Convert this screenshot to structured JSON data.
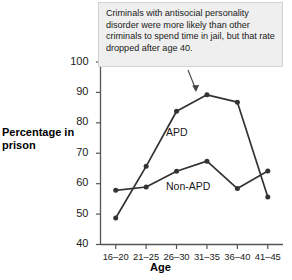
{
  "callout": {
    "text": "Criminals with antisocial personality disorder were more likely than other criminals to spend time in jail, but that rate dropped after age 40.",
    "arrow_icon": "arrow-pointer-icon",
    "background": "#efefef",
    "border": "#d2d2d2"
  },
  "chart_data": {
    "type": "line",
    "title": "",
    "xlabel": "Age",
    "ylabel": "Percentage in prison",
    "categories": [
      "16–20",
      "21–25",
      "26–30",
      "31–35",
      "36–40",
      "41–45"
    ],
    "ylim": [
      40,
      100
    ],
    "yticks": [
      40,
      50,
      60,
      70,
      80,
      90,
      100
    ],
    "ytick_labels": [
      "40",
      "50",
      "60",
      "70",
      "80",
      "90",
      "100"
    ],
    "grid": false,
    "legend": "inline-labels",
    "line_color": "#333333",
    "marker": "circle",
    "series": [
      {
        "name": "APD",
        "values": [
          48.7,
          65.7,
          83.8,
          89.2,
          86.8,
          55.6
        ]
      },
      {
        "name": "Non-APD",
        "values": [
          57.8,
          58.9,
          64.1,
          67.4,
          58.4,
          64.2
        ]
      }
    ],
    "annotations": [
      "Criminals with antisocial personality disorder were more likely than other criminals to spend time in jail, but that rate dropped after age 40."
    ]
  }
}
